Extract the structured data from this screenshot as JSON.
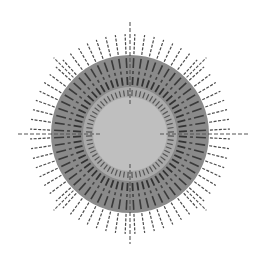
{
  "diagram": {
    "title": "",
    "type": "radial-sunburst",
    "center": [
      130,
      134
    ],
    "background": "#ffffff",
    "discs": [
      {
        "name": "outer-disc",
        "radius": 79,
        "color": "#8a8a8a"
      },
      {
        "name": "light-ring",
        "radius": 47,
        "color": "#a9a9a9"
      },
      {
        "name": "inner-disc",
        "radius": 37,
        "color": "#bfbfbf"
      }
    ],
    "tick_rings": [
      {
        "name": "outer-spikes",
        "count": 64,
        "r1": 80,
        "r2": 100,
        "width": 1.2,
        "color": "#4a4a4a",
        "dash": "3 1.5"
      },
      {
        "name": "outer-ticks",
        "count": 64,
        "r1": 66,
        "r2": 76,
        "width": 1.6,
        "color": "#3a3a3a",
        "dash": ""
      },
      {
        "name": "mid-dots",
        "count": 64,
        "r1": 60,
        "r2": 63,
        "width": 1.6,
        "color": "#444444",
        "dash": ""
      },
      {
        "name": "mid-ticks",
        "count": 64,
        "r1": 49,
        "r2": 57,
        "width": 1.8,
        "color": "#333333",
        "dash": ""
      },
      {
        "name": "inner-ticks",
        "count": 64,
        "r1": 38,
        "r2": 44,
        "width": 1.2,
        "color": "#555555",
        "dash": ""
      }
    ],
    "axis_spikes": [
      {
        "angle": 0,
        "r1": 30,
        "r2": 113,
        "color": "#555555"
      },
      {
        "angle": 90,
        "r1": 30,
        "r2": 120,
        "color": "#555555"
      },
      {
        "angle": 180,
        "r1": 30,
        "r2": 110,
        "color": "#555555"
      },
      {
        "angle": 270,
        "r1": 30,
        "r2": 112,
        "color": "#555555"
      }
    ],
    "diagonal_spikes": [
      {
        "angle": 45,
        "r1": 80,
        "r2": 108
      },
      {
        "angle": 135,
        "r1": 80,
        "r2": 108
      },
      {
        "angle": 225,
        "r1": 80,
        "r2": 108
      },
      {
        "angle": 315,
        "r1": 80,
        "r2": 108
      }
    ]
  }
}
